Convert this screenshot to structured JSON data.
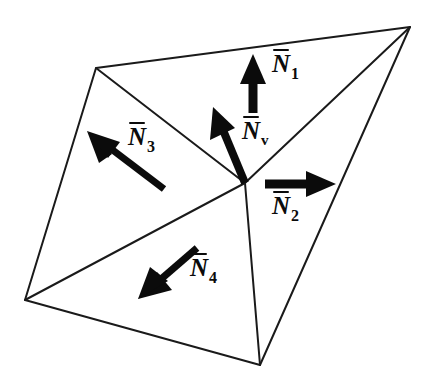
{
  "figure": {
    "background_color": "#ffffff",
    "line_color": "#1a1a1a",
    "arrow_color": "#0b0b0b"
  },
  "geometry": {
    "outer_vertices": [
      {
        "name": "top-left",
        "x": 96,
        "y": 68
      },
      {
        "name": "apex-right",
        "x": 410,
        "y": 27
      },
      {
        "name": "bottom",
        "x": 260,
        "y": 365
      },
      {
        "name": "bottom-left",
        "x": 25,
        "y": 300
      }
    ],
    "center_vertex": {
      "name": "center",
      "x": 245,
      "y": 183
    },
    "internal_edges": [
      {
        "from": "top-left",
        "to": "center"
      },
      {
        "from": "apex-right",
        "to": "center"
      },
      {
        "from": "bottom",
        "to": "center"
      },
      {
        "from": "bottom-left",
        "to": "center"
      }
    ]
  },
  "vectors": [
    {
      "id": "N1",
      "symbol": "N",
      "subscript": "1",
      "label": "N̄₁",
      "direction": "up",
      "tail": {
        "x": 253,
        "y": 113
      },
      "tip": {
        "x": 253,
        "y": 56
      },
      "label_pos": {
        "x": 272,
        "y": 57
      }
    },
    {
      "id": "Nv",
      "symbol": "N",
      "subscript": "v",
      "label": "N̄ᵥ",
      "direction": "up-left",
      "tail": {
        "x": 245,
        "y": 183
      },
      "tip": {
        "x": 215,
        "y": 110
      },
      "label_pos": {
        "x": 242,
        "y": 124
      }
    },
    {
      "id": "N2",
      "symbol": "N",
      "subscript": "2",
      "label": "N̄₂",
      "direction": "right",
      "tail": {
        "x": 265,
        "y": 184
      },
      "tip": {
        "x": 334,
        "y": 184
      },
      "label_pos": {
        "x": 272,
        "y": 198
      }
    },
    {
      "id": "N3",
      "symbol": "N",
      "subscript": "3",
      "label": "N̄₃",
      "direction": "up-left",
      "tail": {
        "x": 163,
        "y": 188
      },
      "tip": {
        "x": 90,
        "y": 133
      },
      "label_pos": {
        "x": 128,
        "y": 129
      }
    },
    {
      "id": "N4",
      "symbol": "N",
      "subscript": "4",
      "label": "N̄₄",
      "direction": "down-left",
      "tail": {
        "x": 196,
        "y": 249
      },
      "tip": {
        "x": 141,
        "y": 297
      },
      "label_pos": {
        "x": 190,
        "y": 260
      }
    }
  ]
}
